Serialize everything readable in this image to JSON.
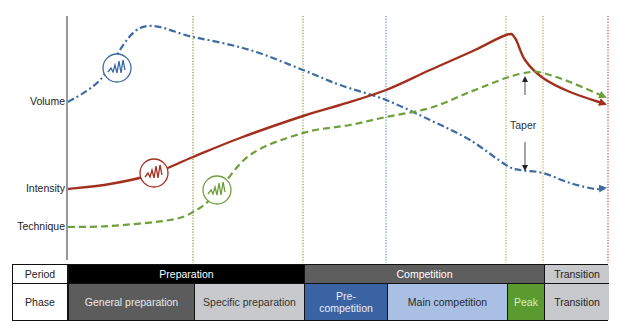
{
  "chart_data": {
    "type": "line",
    "title": "",
    "xlabel": "",
    "ylabel": "",
    "grid": false,
    "y_axis_labels": [
      {
        "text": "Volume",
        "y": 102
      },
      {
        "text": "Intensity",
        "y": 189
      },
      {
        "text": "Technique",
        "y": 227
      }
    ],
    "series": [
      {
        "name": "Volume",
        "color": "#3d6ba3",
        "style": "dash-dot",
        "icon": "wave-circle",
        "points": [
          [
            68,
            102
          ],
          [
            100,
            80
          ],
          [
            140,
            28
          ],
          [
            193,
            37
          ],
          [
            250,
            50
          ],
          [
            303,
            70
          ],
          [
            340,
            85
          ],
          [
            386,
            100
          ],
          [
            430,
            120
          ],
          [
            470,
            140
          ],
          [
            506,
            165
          ],
          [
            520,
            170
          ],
          [
            543,
            173
          ],
          [
            570,
            183
          ],
          [
            595,
            189
          ],
          [
            605,
            188
          ]
        ]
      },
      {
        "name": "Intensity",
        "color": "#a3301f",
        "style": "solid",
        "icon": "wave-circle",
        "points": [
          [
            68,
            189
          ],
          [
            110,
            184
          ],
          [
            150,
            175
          ],
          [
            193,
            157
          ],
          [
            240,
            138
          ],
          [
            303,
            116
          ],
          [
            340,
            105
          ],
          [
            386,
            90
          ],
          [
            430,
            70
          ],
          [
            475,
            50
          ],
          [
            506,
            35
          ],
          [
            515,
            38
          ],
          [
            525,
            60
          ],
          [
            543,
            78
          ],
          [
            570,
            92
          ],
          [
            605,
            104
          ]
        ]
      },
      {
        "name": "Technique",
        "color": "#6ea03c",
        "style": "dashed",
        "icon": "wave-circle",
        "points": [
          [
            68,
            227
          ],
          [
            110,
            226
          ],
          [
            170,
            220
          ],
          [
            193,
            212
          ],
          [
            215,
            195
          ],
          [
            250,
            155
          ],
          [
            303,
            133
          ],
          [
            350,
            125
          ],
          [
            386,
            117
          ],
          [
            430,
            108
          ],
          [
            470,
            92
          ],
          [
            506,
            78
          ],
          [
            530,
            72
          ],
          [
            543,
            73
          ],
          [
            570,
            82
          ],
          [
            605,
            97
          ]
        ]
      }
    ],
    "icons": [
      {
        "series": "Volume",
        "cx": 117,
        "cy": 68,
        "r": 14
      },
      {
        "series": "Intensity",
        "cx": 154,
        "cy": 173,
        "r": 14
      },
      {
        "series": "Technique",
        "cx": 217,
        "cy": 190,
        "r": 14
      }
    ],
    "phase_dividers": [
      {
        "x": 193,
        "color": "#9a8a3a"
      },
      {
        "x": 303,
        "color": "#8a9a3a"
      },
      {
        "x": 386,
        "color": "#5b86c7"
      },
      {
        "x": 506,
        "color": "#8fb84a"
      },
      {
        "x": 543,
        "color": "#c2a13e"
      },
      {
        "x": 608,
        "color": "#b0533d"
      }
    ],
    "annotation": {
      "text": "Taper",
      "x": 525,
      "y_top": 77,
      "y_bottom": 170
    }
  },
  "table": {
    "rows": [
      {
        "label": "Period",
        "cells": [
          {
            "text": "Preparation",
            "x0": 67,
            "x1": 303,
            "bg": "#000000",
            "fg": "#ffffff"
          },
          {
            "text": "Competition",
            "x0": 303,
            "x1": 543,
            "bg": "#5e5e5e",
            "fg": "#ffffff"
          },
          {
            "text": "Transition",
            "x0": 543,
            "x1": 608,
            "bg": "#c8c9cc",
            "fg": "#222222"
          }
        ]
      },
      {
        "label": "Phase",
        "cells": [
          {
            "text": "General preparation",
            "x0": 67,
            "x1": 193,
            "bg": "#5c5c5c",
            "fg": "#e8e8e8"
          },
          {
            "text": "Specific preparation",
            "x0": 193,
            "x1": 303,
            "bg": "#c8c9cc",
            "fg": "#333333"
          },
          {
            "text": "Pre-competition",
            "x0": 303,
            "x1": 386,
            "bg": "#3a63a3",
            "fg": "#e8eefa"
          },
          {
            "text": "Main competition",
            "x0": 386,
            "x1": 506,
            "bg": "#a9bfe3",
            "fg": "#2a2a2a"
          },
          {
            "text": "Peak",
            "x0": 506,
            "x1": 543,
            "bg": "#5a9a2e",
            "fg": "#d9f0c2"
          },
          {
            "text": "Transition",
            "x0": 543,
            "x1": 608,
            "bg": "#c8c9cc",
            "fg": "#222222"
          }
        ]
      }
    ]
  }
}
